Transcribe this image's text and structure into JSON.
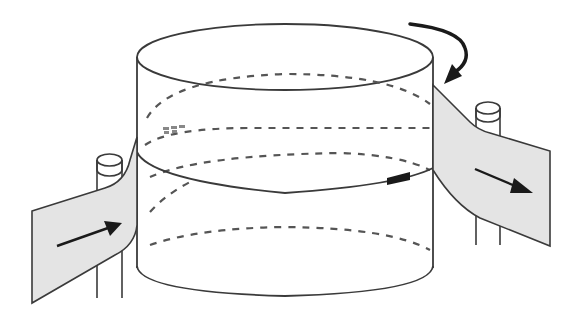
{
  "diagram": {
    "description": "Helical belt wrapping around a cylindrical drum: belt enters from the left, wraps one turn around the rotating drum, and exits to the right.",
    "colors": {
      "stroke": "#3a3a3a",
      "belt_fill": "#e4e4e4",
      "background": "#ffffff",
      "marker": "#1a1a1a"
    },
    "elements": {
      "drum": "cylinder-drum",
      "belt_in": "incoming-belt-sheet",
      "belt_out": "outgoing-belt-sheet",
      "rotation_arrow": "curved-rotation-arrow",
      "in_arrow": "direction-arrow-right",
      "out_arrow": "direction-arrow-right-down",
      "left_post": "guide-post",
      "right_post": "guide-post",
      "marker": "belt-marker-block",
      "label_smudge": "illegible-small-label"
    }
  }
}
